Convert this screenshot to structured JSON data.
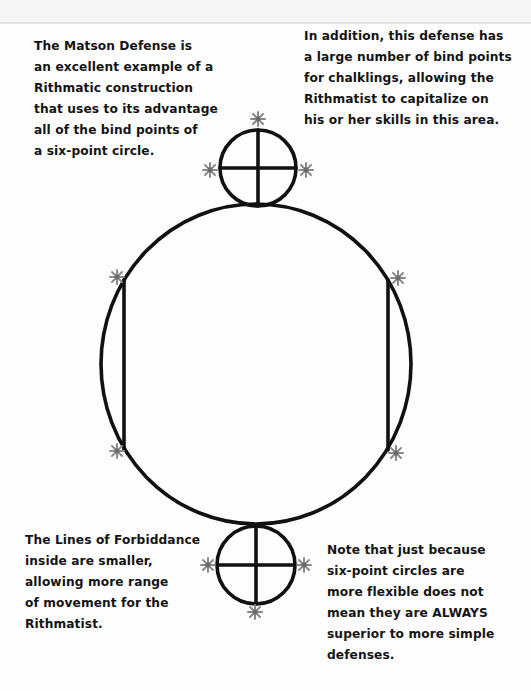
{
  "notes": {
    "top_left": "The Matson Defense is\nan excellent example of a\nRithmatic construction\nthat uses to its advantage\nall of the bind points of\na six-point circle.",
    "top_right": "In addition, this defense has\na large number of bind points\nfor chalklings, allowing the\nRithmatist to capitalize on\nhis or her skills in this area.",
    "bottom_left": "The Lines of Forbiddance\ninside are smaller,\nallowing more range\nof movement for the\nRithmatist.",
    "bottom_right": "Note that just because\nsix-point circles are\nmore flexible does not\nmean they are ALWAYS\nsuperior to more simple\ndefenses."
  },
  "diagram": {
    "name": "Matson Defense",
    "main_circle": {
      "label": "six-point circle",
      "bind_points": 6
    },
    "ward_circles": [
      {
        "position": "top",
        "bind_points": 3
      },
      {
        "position": "bottom",
        "bind_points": 3
      }
    ],
    "lines_of_forbiddance": 2,
    "colors": {
      "chalk": "#111111",
      "bind_point": "#8a8a8a",
      "paper": "#fdfdfd"
    }
  }
}
